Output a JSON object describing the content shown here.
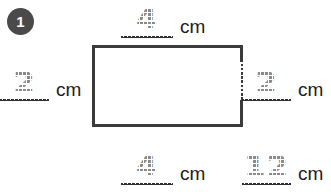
{
  "problem": {
    "number": "1",
    "unit_label": "cm"
  },
  "figure": {
    "shape_name": "rectangle"
  },
  "blanks": {
    "top": {
      "value": "4",
      "unit": "cm"
    },
    "left": {
      "value": "2",
      "unit": "cm"
    },
    "right": {
      "value": "2",
      "unit": "cm"
    },
    "bottom": {
      "value": "4",
      "unit": "cm"
    },
    "total": {
      "value": "12",
      "unit": "cm"
    }
  },
  "colors": {
    "badge_fill": "#4a4a4a",
    "badge_text": "#ffffff",
    "rect_stroke": "#3b3b3b",
    "traced_digit": "#8a8a8a",
    "blank_line": "#2f2f2f",
    "unit_text": "#1d1d1d",
    "page_background": "#ffffff"
  }
}
